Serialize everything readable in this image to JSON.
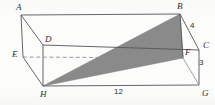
{
  "figure": {
    "shape": "rectangular prism",
    "background_color": "#fcfcfb",
    "line_color": "#55555a",
    "shaded_color": "#8a8a8a",
    "dashed_color": "#8f8f94",
    "vertices": [
      {
        "name": "A",
        "label": "A",
        "x": 21,
        "y": 15,
        "label_x": 16,
        "label_y": 3,
        "position": "top-front-left"
      },
      {
        "name": "B",
        "label": "B",
        "x": 180,
        "y": 14,
        "label_x": 177,
        "label_y": 2,
        "position": "top-front-right"
      },
      {
        "name": "C",
        "label": "C",
        "x": 199,
        "y": 50,
        "label_x": 203,
        "label_y": 41,
        "position": "top-back-right"
      },
      {
        "name": "D",
        "label": "D",
        "x": 43,
        "y": 45,
        "label_x": 45,
        "label_y": 35,
        "position": "top-back-left"
      },
      {
        "name": "E",
        "label": "E",
        "x": 23,
        "y": 57,
        "label_x": 12,
        "label_y": 50,
        "position": "bottom-back-left"
      },
      {
        "name": "F",
        "label": "F",
        "x": 183,
        "y": 58,
        "label_x": 185,
        "label_y": 48,
        "position": "bottom-back-right"
      },
      {
        "name": "G",
        "label": "G",
        "x": 199,
        "y": 85,
        "label_x": 202,
        "label_y": 89,
        "position": "bottom-front-right"
      },
      {
        "name": "H",
        "label": "H",
        "x": 43,
        "y": 86,
        "label_x": 40,
        "label_y": 90,
        "position": "bottom-front-left"
      }
    ],
    "dimensions": [
      {
        "name": "edge-BC-length",
        "value": "4",
        "edge": "BC",
        "label_x": 190,
        "label_y": 22
      },
      {
        "name": "edge-CG-length",
        "value": "3",
        "edge": "CG",
        "label_x": 199,
        "label_y": 59
      },
      {
        "name": "edge-HG-length",
        "value": "12",
        "edge": "HG",
        "label_x": 114,
        "label_y": 88
      }
    ],
    "solid_edges": [
      {
        "name": "edge-AB",
        "from": "A",
        "to": "B"
      },
      {
        "name": "edge-AD",
        "from": "A",
        "to": "D"
      },
      {
        "name": "edge-AE",
        "from": "A",
        "to": "E"
      },
      {
        "name": "edge-DC",
        "from": "D",
        "to": "C"
      },
      {
        "name": "edge-BC",
        "from": "B",
        "to": "C"
      },
      {
        "name": "edge-CG",
        "from": "C",
        "to": "G"
      },
      {
        "name": "edge-EH",
        "from": "E",
        "to": "H"
      },
      {
        "name": "edge-HG",
        "from": "H",
        "to": "G"
      },
      {
        "name": "edge-FG",
        "from": "F",
        "to": "G"
      },
      {
        "name": "edge-BF",
        "from": "B",
        "to": "F"
      },
      {
        "name": "edge-DE",
        "from": "D",
        "to": "E"
      }
    ],
    "dashed_edges": [
      {
        "name": "edge-EF-hidden",
        "from": "E",
        "to": "F"
      }
    ],
    "shaded_triangle": {
      "name": "triangle-HBF",
      "vertices": [
        "H",
        "B",
        "F"
      ],
      "fill": "#8a8a8a"
    }
  }
}
